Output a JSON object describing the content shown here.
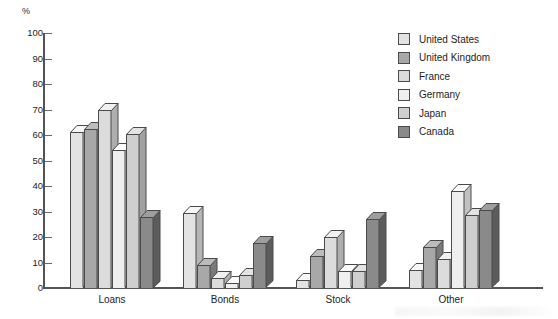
{
  "chart_data": {
    "type": "bar",
    "title": "",
    "subtitle": "",
    "xlabel": "",
    "ylabel": "%",
    "ylim": [
      0,
      100
    ],
    "ytick_step": 10,
    "yticks": [
      100,
      90,
      80,
      70,
      60,
      50,
      40,
      30,
      20,
      10,
      0
    ],
    "grid": false,
    "legend_position": "top-right",
    "categories": [
      "Loans",
      "Bonds",
      "Stock",
      "Other"
    ],
    "series": [
      {
        "name": "United States",
        "color": "#e3e3e3",
        "values": [
          61,
          29.5,
          3,
          7
        ]
      },
      {
        "name": "United Kingdom",
        "color": "#a8a8a8",
        "values": [
          62.5,
          9,
          12.5,
          16
        ]
      },
      {
        "name": "France",
        "color": "#dcdcdc",
        "values": [
          70,
          4,
          20,
          11.5
        ]
      },
      {
        "name": "Germany",
        "color": "#efefef",
        "values": [
          54,
          2,
          6.5,
          38
        ]
      },
      {
        "name": "Japan",
        "color": "#cfcfcf",
        "values": [
          60.5,
          5,
          6.5,
          28.5
        ]
      },
      {
        "name": "Canada",
        "color": "#8a8a8a",
        "values": [
          28,
          17.5,
          27,
          30.5
        ]
      }
    ]
  },
  "axis": {
    "unit_label": "%"
  },
  "legend": {
    "items": [
      {
        "label": "United States"
      },
      {
        "label": "United Kingdom"
      },
      {
        "label": "France"
      },
      {
        "label": "Germany"
      },
      {
        "label": "Japan"
      },
      {
        "label": "Canada"
      }
    ]
  }
}
